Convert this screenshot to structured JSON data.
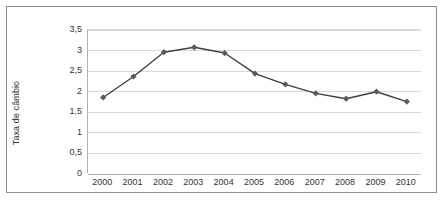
{
  "chart_data": {
    "type": "line",
    "title": "",
    "xlabel": "",
    "ylabel": "Taxa de câmbio",
    "categories": [
      "2000",
      "2001",
      "2002",
      "2003",
      "2004",
      "2005",
      "2006",
      "2007",
      "2008",
      "2009",
      "2010"
    ],
    "values": [
      1.86,
      2.37,
      2.96,
      3.08,
      2.94,
      2.44,
      2.18,
      1.96,
      1.83,
      2.0,
      1.76
    ],
    "series": [
      {
        "name": "Taxa de câmbio",
        "values": [
          1.86,
          2.37,
          2.96,
          3.08,
          2.94,
          2.44,
          2.18,
          1.96,
          1.83,
          2.0,
          1.76
        ]
      }
    ],
    "ylim": [
      0,
      3.5
    ],
    "ytick_labels": [
      "0",
      "0,5",
      "1",
      "1,5",
      "2",
      "2,5",
      "3",
      "3,5"
    ],
    "ytick_values": [
      0,
      0.5,
      1,
      1.5,
      2,
      2.5,
      3,
      3.5
    ],
    "grid": true,
    "legend": "none",
    "line_color": "#3f3f3f",
    "marker_color": "#5a5a5a",
    "marker_shape": "diamond",
    "gridline_color": "#d9d9d9",
    "axis_color": "#b0b0b0",
    "frame_color": "#8c8c8c",
    "background_color": "#ffffff"
  }
}
